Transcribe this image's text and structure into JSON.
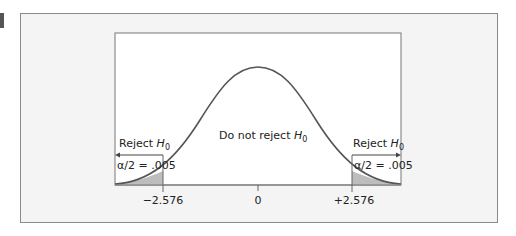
{
  "figure": {
    "center_label": "Do not reject",
    "hypothesis": "H",
    "hypothesis_sub": "0",
    "left_region": {
      "label": "Reject",
      "alpha_text": "α/2 = .005"
    },
    "right_region": {
      "label": "Reject",
      "alpha_text": "α/2 = .005"
    },
    "ticks": [
      "−2.576",
      "0",
      "+2.576"
    ],
    "colors": {
      "curve": "#555555",
      "shade": "#bdbdbd",
      "frame_bg": "#f4f4f4",
      "plot_bg": "#ffffff"
    }
  }
}
